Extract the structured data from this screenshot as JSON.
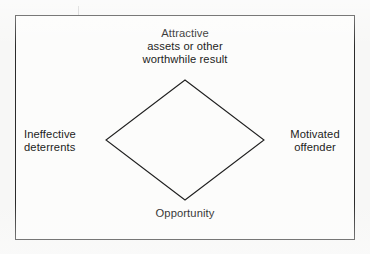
{
  "figure": {
    "type": "crime-triangle-diamond-diagram",
    "background_color": "#f7f7f6",
    "frame": {
      "stroke_color": "#2b2b2b",
      "fill_color": "#fcfcfb"
    },
    "shape": {
      "name": "diamond",
      "stroke_color": "#1f1f1f",
      "fill": "none",
      "vertices": {
        "top": [
          185,
          80
        ],
        "right": [
          264,
          140
        ],
        "bottom": [
          185,
          200
        ],
        "left": [
          106,
          140
        ]
      }
    },
    "labels": {
      "top": "Attractive\nassets or other\nworthwhile result",
      "left": "Ineffective\ndeterrents",
      "right": "Motivated\noffender",
      "bottom": "Opportunity"
    }
  }
}
